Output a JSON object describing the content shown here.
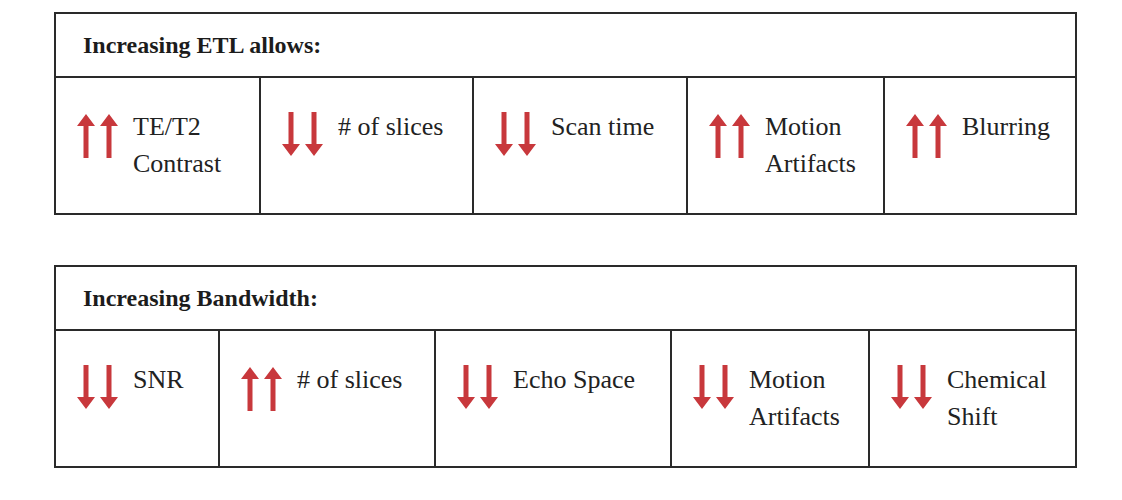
{
  "colors": {
    "arrow": "#c8383c",
    "border": "#2a2a2a",
    "text": "#222222"
  },
  "tables": [
    {
      "title": "Increasing ETL allows:",
      "cells": [
        {
          "direction": "up",
          "icon": "double-up-arrow-icon",
          "label": "TE/T2\nContrast"
        },
        {
          "direction": "down",
          "icon": "double-down-arrow-icon",
          "label": "# of slices"
        },
        {
          "direction": "down",
          "icon": "double-down-arrow-icon",
          "label": "Scan time"
        },
        {
          "direction": "up",
          "icon": "double-up-arrow-icon",
          "label": "Motion\nArtifacts"
        },
        {
          "direction": "up",
          "icon": "double-up-arrow-icon",
          "label": "Blurring"
        }
      ]
    },
    {
      "title": "Increasing Bandwidth:",
      "cells": [
        {
          "direction": "down",
          "icon": "double-down-arrow-icon",
          "label": "SNR"
        },
        {
          "direction": "up",
          "icon": "double-up-arrow-icon",
          "label": "# of slices"
        },
        {
          "direction": "down",
          "icon": "double-down-arrow-icon",
          "label": "Echo Space"
        },
        {
          "direction": "down",
          "icon": "double-down-arrow-icon",
          "label": "Motion\nArtifacts"
        },
        {
          "direction": "down",
          "icon": "double-down-arrow-icon",
          "label": "Chemical\nShift"
        }
      ]
    }
  ]
}
